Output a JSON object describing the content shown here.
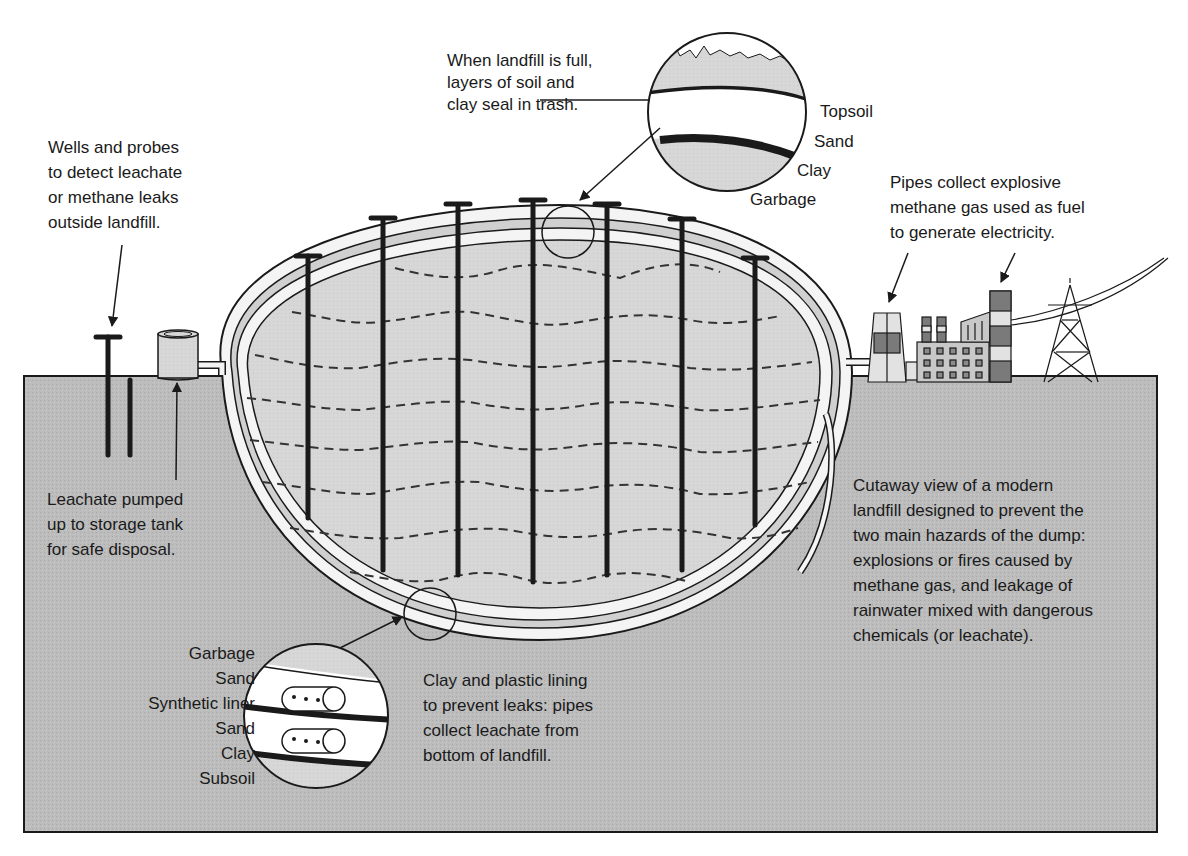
{
  "diagram": {
    "title": "Cutaway view of a modern landfill",
    "colors": {
      "background": "#ffffff",
      "ground": "#bdbdbd",
      "landfill_fill": "#d6d6d6",
      "liner_white": "#f4f4f4",
      "ink": "#1a1a1a",
      "dark_band": "#7a7a7a",
      "light_band": "#e2e2e2"
    }
  },
  "labels": {
    "cap_callout": {
      "lines": [
        "When landfill is full,",
        "layers of soil and",
        "clay seal in trash."
      ]
    },
    "cap_layers": [
      "Topsoil",
      "Sand",
      "Clay",
      "Garbage"
    ],
    "wells_callout": {
      "lines": [
        "Wells and probes",
        "to detect leachate",
        "or methane leaks",
        "outside landfill."
      ]
    },
    "leachate_callout": {
      "lines": [
        "Leachate pumped",
        "up to storage tank",
        "for safe disposal."
      ]
    },
    "methane_callout": {
      "lines": [
        "Pipes collect explosive",
        "methane gas used as fuel",
        "to generate electricity."
      ]
    },
    "summary": {
      "lines": [
        "Cutaway view of a modern",
        "landfill designed to prevent the",
        "two main hazards of the dump:",
        "explosions or fires caused by",
        "methane gas, and leakage of",
        "rainwater mixed with dangerous",
        "chemicals (or leachate)."
      ]
    },
    "liner_layers": [
      "Garbage",
      "Sand",
      "Synthetic liner",
      "Sand",
      "Clay",
      "Subsoil"
    ],
    "liner_callout": {
      "lines": [
        "Clay and plastic lining",
        "to prevent leaks: pipes",
        "collect leachate from",
        "bottom of landfill."
      ]
    }
  },
  "components": {
    "gas_wells_count": 7,
    "monitoring_probes_count": 2,
    "storage_tank": "leachate-storage-tank",
    "power_plant": "methane-power-plant",
    "transmission_tower": "power-pylon"
  }
}
